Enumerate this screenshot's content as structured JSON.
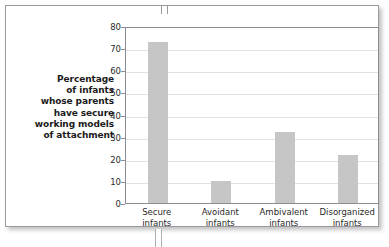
{
  "figure": {
    "axis_title_lines": [
      "Percentage",
      "of infants",
      "whose parents",
      "have secure",
      "working models",
      "of attachment"
    ]
  },
  "colors": {
    "bar": "#c6c6c6",
    "grid": "#e2e2e2",
    "axis": "#8d8d91",
    "frame": "#9a9a9e",
    "text": "#2a2a2a"
  },
  "chart_data": {
    "type": "bar",
    "title": "",
    "xlabel": "",
    "ylabel": "Percentage of infants whose parents have secure working models of attachment",
    "categories": [
      "Secure infants",
      "Avoidant infants",
      "Ambivalent infants",
      "Disorganized infants"
    ],
    "category_lines": [
      [
        "Secure",
        "infants"
      ],
      [
        "Avoidant",
        "infants"
      ],
      [
        "Ambivalent",
        "infants"
      ],
      [
        "Disorganized",
        "infants"
      ]
    ],
    "values": [
      73,
      10,
      32,
      21.5
    ],
    "ylim": [
      0,
      80
    ],
    "ytick_step": 10,
    "yticks": [
      0,
      10,
      20,
      30,
      40,
      50,
      60,
      70,
      80
    ],
    "grid": true,
    "legend": false
  }
}
